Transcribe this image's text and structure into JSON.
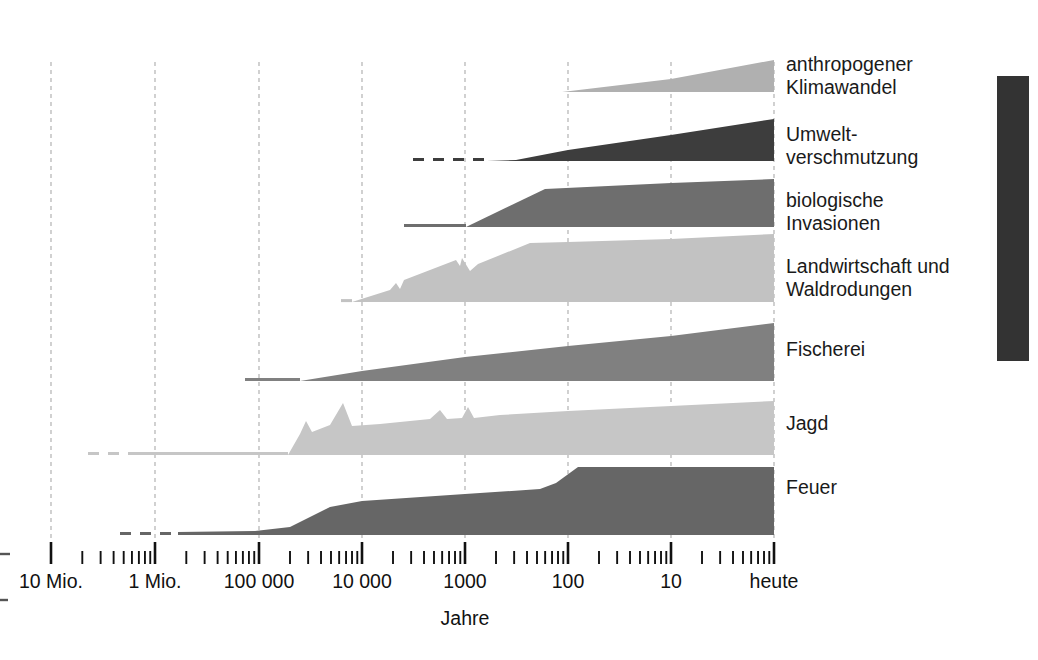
{
  "figure": {
    "width": 1038,
    "height": 660,
    "background": "#ffffff",
    "axis_title": "Jahre",
    "right_margin_bar_color": "#333333"
  },
  "axis": {
    "label": "Jahre",
    "orientation": "horizontal",
    "scale": "logarithmic-reversed",
    "tick_labels": [
      "10 Mio.",
      "1 Mio.",
      "100 000",
      "10 000",
      "1000",
      "100",
      "10",
      "heute"
    ],
    "tick_values": [
      10000000,
      1000000,
      100000,
      10000,
      1000,
      100,
      10,
      1
    ],
    "tick_x_positions": [
      51,
      155,
      259,
      362,
      465,
      568,
      671,
      774
    ],
    "minor_ticks_per_decade": 9,
    "gridlines": true,
    "gridline_color": "#b8b8b8",
    "gridline_style": "dashed",
    "gridline_x_positions": [
      51,
      155,
      259,
      362,
      465,
      568,
      671,
      774
    ]
  },
  "chart_data": {
    "type": "area",
    "title": "",
    "subtitle": "",
    "xlabel": "Jahre",
    "ylabel": "",
    "x_axis_type": "log-reversed-time-before-present",
    "x_tick_labels": [
      "10 Mio.",
      "1 Mio.",
      "100 000",
      "10 000",
      "1000",
      "100",
      "10",
      "heute"
    ],
    "legend_position": "right-inline-labels",
    "grid": true,
    "series": [
      {
        "name": "anthropogener Klimawandel",
        "label_lines": [
          "anthropogener",
          "Klimawandel"
        ],
        "color": "#b0b0b0",
        "baseline_y": 92,
        "label_y": 66,
        "lead_line": "none",
        "points": [
          {
            "x": 562,
            "h": 0
          },
          {
            "x": 671,
            "h": 13
          },
          {
            "x": 774,
            "h": 32
          }
        ]
      },
      {
        "name": "Umweltverschmutzung",
        "label_lines": [
          "Umwelt-",
          "verschmutzung"
        ],
        "color": "#3d3d3d",
        "baseline_y": 161,
        "label_y": 136,
        "lead_line": "dashed-then-solid",
        "lead_dash_start": 413,
        "lead_dash_end": 487,
        "points": [
          {
            "x": 487,
            "h": 0
          },
          {
            "x": 516,
            "h": 1
          },
          {
            "x": 568,
            "h": 11
          },
          {
            "x": 671,
            "h": 26
          },
          {
            "x": 774,
            "h": 42
          }
        ]
      },
      {
        "name": "biologische Invasionen",
        "label_lines": [
          "biologische",
          "Invasionen"
        ],
        "color": "#6e6e6e",
        "baseline_y": 227,
        "label_y": 202,
        "lead_line": "solid",
        "lead_solid_start": 404,
        "points": [
          {
            "x": 466,
            "h": 0
          },
          {
            "x": 545,
            "h": 38
          },
          {
            "x": 671,
            "h": 44
          },
          {
            "x": 774,
            "h": 48
          }
        ]
      },
      {
        "name": "Landwirtschaft und Waldrodungen",
        "label_lines": [
          "Landwirtschaft und",
          "Waldrodungen"
        ],
        "color": "#c2c2c2",
        "baseline_y": 302,
        "label_y": 268,
        "lead_line": "solid",
        "lead_solid_start": 341,
        "points": [
          {
            "x": 352,
            "h": 0
          },
          {
            "x": 390,
            "h": 12
          },
          {
            "x": 396,
            "h": 19
          },
          {
            "x": 400,
            "h": 13
          },
          {
            "x": 404,
            "h": 22
          },
          {
            "x": 430,
            "h": 32
          },
          {
            "x": 456,
            "h": 42
          },
          {
            "x": 460,
            "h": 36
          },
          {
            "x": 462,
            "h": 44
          },
          {
            "x": 470,
            "h": 31
          },
          {
            "x": 478,
            "h": 38
          },
          {
            "x": 530,
            "h": 59
          },
          {
            "x": 568,
            "h": 60
          },
          {
            "x": 671,
            "h": 63
          },
          {
            "x": 774,
            "h": 68
          }
        ]
      },
      {
        "name": "Fischerei",
        "label_lines": [
          "Fischerei"
        ],
        "color": "#808080",
        "baseline_y": 381,
        "label_y": 351,
        "lead_line": "solid",
        "lead_solid_start": 245,
        "points": [
          {
            "x": 300,
            "h": 0
          },
          {
            "x": 362,
            "h": 10
          },
          {
            "x": 465,
            "h": 24
          },
          {
            "x": 568,
            "h": 35
          },
          {
            "x": 671,
            "h": 45
          },
          {
            "x": 774,
            "h": 58
          }
        ]
      },
      {
        "name": "Jagd",
        "label_lines": [
          "Jagd"
        ],
        "color": "#c6c6c6",
        "baseline_y": 455,
        "label_y": 425,
        "lead_line": "dashed-then-solid",
        "lead_dash_start": 88,
        "lead_dash_end": 128,
        "points": [
          {
            "x": 288,
            "h": 0
          },
          {
            "x": 300,
            "h": 21
          },
          {
            "x": 306,
            "h": 34
          },
          {
            "x": 312,
            "h": 23
          },
          {
            "x": 330,
            "h": 30
          },
          {
            "x": 343,
            "h": 52
          },
          {
            "x": 352,
            "h": 29
          },
          {
            "x": 380,
            "h": 31
          },
          {
            "x": 430,
            "h": 36
          },
          {
            "x": 440,
            "h": 45
          },
          {
            "x": 447,
            "h": 36
          },
          {
            "x": 462,
            "h": 37
          },
          {
            "x": 468,
            "h": 48
          },
          {
            "x": 474,
            "h": 37
          },
          {
            "x": 500,
            "h": 40
          },
          {
            "x": 568,
            "h": 44
          },
          {
            "x": 671,
            "h": 49
          },
          {
            "x": 774,
            "h": 54
          }
        ]
      },
      {
        "name": "Feuer",
        "label_lines": [
          "Feuer"
        ],
        "color": "#666666",
        "baseline_y": 535,
        "label_y": 489,
        "lead_line": "dashed-then-solid",
        "lead_dash_start": 120,
        "lead_dash_end": 178,
        "points": [
          {
            "x": 178,
            "h": 3
          },
          {
            "x": 255,
            "h": 4
          },
          {
            "x": 290,
            "h": 8
          },
          {
            "x": 330,
            "h": 28
          },
          {
            "x": 362,
            "h": 34
          },
          {
            "x": 465,
            "h": 41
          },
          {
            "x": 540,
            "h": 46
          },
          {
            "x": 556,
            "h": 52
          },
          {
            "x": 578,
            "h": 68
          },
          {
            "x": 671,
            "h": 68
          },
          {
            "x": 774,
            "h": 68
          }
        ]
      }
    ]
  },
  "decorations": {
    "left_edge_dashes": [
      {
        "x1": 0,
        "x2": 10,
        "y": 554
      },
      {
        "x1": 0,
        "x2": 8,
        "y": 600
      }
    ],
    "right_bar": {
      "x": 997,
      "y": 76,
      "width": 32,
      "height": 285,
      "color": "#333333"
    }
  }
}
